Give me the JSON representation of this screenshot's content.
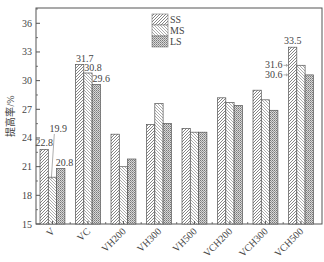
{
  "chart_data": {
    "type": "bar",
    "title": "",
    "xlabel": "",
    "ylabel": "提高率/%",
    "ylim": [
      15,
      37.6
    ],
    "yticks": [
      15,
      18,
      21,
      24,
      27,
      30,
      33,
      36
    ],
    "grid": false,
    "legend_position": "upper-center",
    "categories": [
      "V",
      "VC",
      "VH200",
      "VH300",
      "VH500",
      "VCH200",
      "VCH300",
      "VCH500"
    ],
    "series": [
      {
        "name": "SS",
        "pattern": "forward-diagonal",
        "values": [
          22.8,
          31.7,
          24.4,
          25.4,
          25.0,
          28.2,
          29.0,
          33.5
        ]
      },
      {
        "name": "MS",
        "pattern": "backward-diagonal",
        "values": [
          19.9,
          30.8,
          21.0,
          27.6,
          24.6,
          27.7,
          28.0,
          31.6
        ]
      },
      {
        "name": "LS",
        "pattern": "crosshatch",
        "values": [
          20.8,
          29.6,
          21.8,
          25.5,
          24.6,
          27.4,
          26.9,
          30.6
        ]
      }
    ],
    "annotations": [
      {
        "category": "V",
        "series": "SS",
        "text": "22.8"
      },
      {
        "category": "V",
        "series": "MS",
        "text": "19.9",
        "leader_line": true
      },
      {
        "category": "V",
        "series": "LS",
        "text": "20.8"
      },
      {
        "category": "VC",
        "series": "SS",
        "text": "31.7"
      },
      {
        "category": "VC",
        "series": "MS",
        "text": "30.8"
      },
      {
        "category": "VC",
        "series": "LS",
        "text": "29.6"
      },
      {
        "category": "VCH500",
        "series": "SS",
        "text": "33.5"
      },
      {
        "category": "VCH500",
        "series": "MS",
        "text": "31.6",
        "arrow": true
      },
      {
        "category": "VCH500",
        "series": "LS",
        "text": "30.6",
        "arrow": true
      }
    ],
    "colors": {
      "axis": "#555555",
      "bar_stroke": "#555555",
      "hatch": "#666666",
      "background": "#ffffff"
    }
  }
}
